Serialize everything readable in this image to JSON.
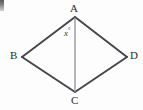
{
  "figure": {
    "background_color": "#fdfdfd",
    "line_color": "#44444a",
    "diagonal_color": "#8e8e96",
    "label_color": "#2b2b2b",
    "labels": {
      "vertex_a": "A",
      "vertex_b": "B",
      "vertex_c": "C",
      "vertex_d": "D",
      "angle_x": "x",
      "degree_symbol": "°"
    },
    "geometry": {
      "points": {
        "A": [
          75,
          17
        ],
        "B": [
          22,
          57
        ],
        "C": [
          75,
          92
        ],
        "D": [
          127,
          57
        ]
      },
      "edges": [
        [
          "A",
          "B"
        ],
        [
          "B",
          "C"
        ],
        [
          "C",
          "D"
        ],
        [
          "D",
          "A"
        ]
      ],
      "diagonals": [
        [
          "A",
          "C"
        ]
      ]
    }
  }
}
